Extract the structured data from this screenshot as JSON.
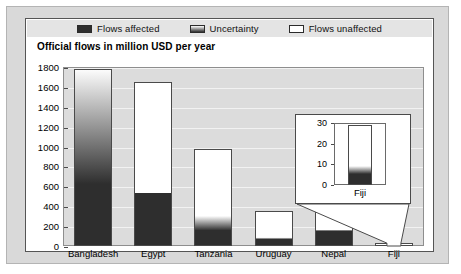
{
  "legend": {
    "items": [
      {
        "label": "Flows affected",
        "swatch": "solid-dark-icon",
        "color": "#2e2e2e"
      },
      {
        "label": "Uncertainty",
        "swatch": "gradient-icon",
        "color": "#8a8a8a"
      },
      {
        "label": "Flows unaffected",
        "swatch": "solid-white-icon",
        "color": "#ffffff"
      }
    ]
  },
  "chart_data": {
    "type": "bar",
    "title": "Official flows in million USD per year",
    "xlabel": "",
    "ylabel": "",
    "ylim": [
      0,
      1800
    ],
    "yticks": [
      0,
      200,
      400,
      600,
      800,
      1000,
      1200,
      1400,
      1600,
      1800
    ],
    "grid": true,
    "legend_position": "top",
    "categories": [
      "Bangladesh",
      "Egypt",
      "Tanzania",
      "Uruguay",
      "Nepal",
      "Fiji"
    ],
    "series": [
      {
        "name": "Flows affected",
        "values": [
          620,
          530,
          150,
          60,
          150,
          5
        ]
      },
      {
        "name": "Uncertainty",
        "values": [
          1180,
          0,
          150,
          20,
          10,
          4
        ]
      },
      {
        "name": "Flows unaffected",
        "values": [
          0,
          1120,
          680,
          270,
          190,
          20
        ]
      }
    ],
    "totals": [
      1780,
      1650,
      980,
      350,
      350,
      29
    ],
    "inset": {
      "title": "Fiji",
      "ylim": [
        0,
        30
      ],
      "yticks": [
        0,
        10,
        20,
        30
      ],
      "categories": [
        "Fiji"
      ],
      "series": [
        {
          "name": "Flows affected",
          "values": [
            5
          ]
        },
        {
          "name": "Uncertainty",
          "values": [
            4
          ]
        },
        {
          "name": "Flows unaffected",
          "values": [
            20
          ]
        }
      ],
      "totals": [
        29
      ]
    }
  },
  "colors": {
    "affected": "#2e2e2e",
    "unaffected": "#ffffff",
    "plot_background": "#dcdcdc",
    "gridline": "#f2f2f2",
    "frame": "#d9d9d9",
    "legend_background": "#e4e4e4",
    "axis": "#4a4a4a"
  }
}
